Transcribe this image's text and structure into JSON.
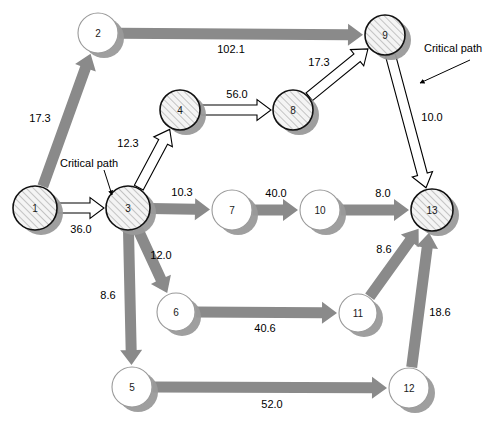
{
  "diagram": {
    "type": "directed-network",
    "canvas": {
      "width": 483,
      "height": 423
    },
    "colors": {
      "gray_arrow": "#8a8a8a",
      "node_outline": "#111111",
      "node_fill_plain": "#ffffff",
      "node_hatch_fill": "#f2f2f2",
      "node_hatch_stroke": "#8a8a8a",
      "node_shadow": "#9a9a9a",
      "white_arrow_fill": "#ffffff",
      "white_arrow_stroke": "#000000",
      "background": "#ffffff"
    },
    "nodes": [
      {
        "id": "n1",
        "label": "1",
        "cx": 35,
        "cy": 208,
        "r": 22,
        "style": "hatched",
        "critical": true
      },
      {
        "id": "n2",
        "label": "2",
        "cx": 98,
        "cy": 33,
        "r": 20,
        "style": "plain",
        "critical": false
      },
      {
        "id": "n3",
        "label": "3",
        "cx": 128,
        "cy": 208,
        "r": 22,
        "style": "hatched",
        "critical": true
      },
      {
        "id": "n4",
        "label": "4",
        "cx": 180,
        "cy": 110,
        "r": 20,
        "style": "hatched",
        "critical": true
      },
      {
        "id": "n5",
        "label": "5",
        "cx": 132,
        "cy": 387,
        "r": 20,
        "style": "plain",
        "critical": false
      },
      {
        "id": "n6",
        "label": "6",
        "cx": 176,
        "cy": 312,
        "r": 19,
        "style": "plain",
        "critical": false
      },
      {
        "id": "n7",
        "label": "7",
        "cx": 232,
        "cy": 210,
        "r": 20,
        "style": "plain",
        "critical": false
      },
      {
        "id": "n8",
        "label": "8",
        "cx": 293,
        "cy": 110,
        "r": 20,
        "style": "hatched",
        "critical": true
      },
      {
        "id": "n9",
        "label": "9",
        "cx": 385,
        "cy": 35,
        "r": 20,
        "style": "hatched",
        "critical": true
      },
      {
        "id": "n10",
        "label": "10",
        "cx": 320,
        "cy": 210,
        "r": 20,
        "style": "plain",
        "critical": false
      },
      {
        "id": "n11",
        "label": "11",
        "cx": 358,
        "cy": 313,
        "r": 19,
        "style": "plain",
        "critical": false
      },
      {
        "id": "n12",
        "label": "12",
        "cx": 409,
        "cy": 388,
        "r": 20,
        "style": "plain",
        "critical": false
      },
      {
        "id": "n13",
        "label": "13",
        "cx": 432,
        "cy": 210,
        "r": 21,
        "style": "hatched",
        "critical": true
      }
    ],
    "edges": [
      {
        "id": "e1_2",
        "from": "n1",
        "to": "n2",
        "weight": "17.3",
        "kind": "gray",
        "label_x": 40,
        "label_y": 118
      },
      {
        "id": "e1_3",
        "from": "n1",
        "to": "n3",
        "weight": "36.0",
        "kind": "white",
        "label_x": 81,
        "label_y": 229
      },
      {
        "id": "e2_9",
        "from": "n2",
        "to": "n9",
        "weight": "102.1",
        "kind": "gray",
        "label_x": 231,
        "label_y": 49
      },
      {
        "id": "e3_4",
        "from": "n3",
        "to": "n4",
        "weight": "12.3",
        "kind": "white",
        "label_x": 128,
        "label_y": 143
      },
      {
        "id": "e3_7",
        "from": "n3",
        "to": "n7",
        "weight": "10.3",
        "kind": "gray",
        "label_x": 182,
        "label_y": 192
      },
      {
        "id": "e3_6",
        "from": "n3",
        "to": "n6",
        "weight": "12.0",
        "kind": "gray",
        "label_x": 161,
        "label_y": 255
      },
      {
        "id": "e3_5",
        "from": "n3",
        "to": "n5",
        "weight": "8.6",
        "kind": "gray",
        "label_x": 108,
        "label_y": 295
      },
      {
        "id": "e4_8",
        "from": "n4",
        "to": "n8",
        "weight": "56.0",
        "kind": "white",
        "label_x": 237,
        "label_y": 94
      },
      {
        "id": "e5_12",
        "from": "n5",
        "to": "n12",
        "weight": "52.0",
        "kind": "gray",
        "label_x": 272,
        "label_y": 404
      },
      {
        "id": "e6_11",
        "from": "n6",
        "to": "n11",
        "weight": "40.6",
        "kind": "gray",
        "label_x": 265,
        "label_y": 328
      },
      {
        "id": "e7_10",
        "from": "n7",
        "to": "n10",
        "weight": "40.0",
        "kind": "gray",
        "label_x": 276,
        "label_y": 193
      },
      {
        "id": "e8_9",
        "from": "n8",
        "to": "n9",
        "weight": "17.3",
        "kind": "white",
        "label_x": 319,
        "label_y": 62
      },
      {
        "id": "e9_13",
        "from": "n9",
        "to": "n13",
        "weight": "10.0",
        "kind": "white",
        "label_x": 432,
        "label_y": 117
      },
      {
        "id": "e10_13",
        "from": "n10",
        "to": "n13",
        "weight": "8.0",
        "kind": "gray",
        "label_x": 383,
        "label_y": 193
      },
      {
        "id": "e11_13",
        "from": "n11",
        "to": "n13",
        "weight": "8.6",
        "kind": "gray",
        "label_x": 384,
        "label_y": 249
      },
      {
        "id": "e12_13",
        "from": "n12",
        "to": "n13",
        "weight": "18.6",
        "kind": "gray",
        "label_x": 440,
        "label_y": 312
      }
    ],
    "annotations": [
      {
        "id": "a1",
        "text": "Critical path",
        "x": 60,
        "y": 163,
        "leader": "M 104 170 L 112 195"
      },
      {
        "id": "a2",
        "text": "Critical path",
        "x": 424,
        "y": 48,
        "leader": "M 470 60 L 420 83"
      }
    ]
  }
}
